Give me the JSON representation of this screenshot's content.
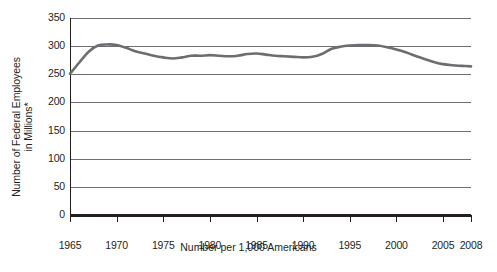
{
  "chart_data": {
    "type": "line",
    "title": "",
    "xlabel": "Number per 1,000 Americans",
    "ylabel_line1": "Number of Federal Employees",
    "ylabel_line2": "in Millions*",
    "grid": true,
    "legend": "none",
    "xlim": [
      1965,
      2008
    ],
    "ylim": [
      0,
      350
    ],
    "yticks": [
      0,
      50,
      100,
      150,
      200,
      250,
      300,
      350
    ],
    "ytick_labels": [
      "0",
      "50",
      "100",
      "150",
      "200",
      "250",
      "300",
      "350"
    ],
    "xticks": [
      1965,
      1970,
      1975,
      1980,
      1985,
      1990,
      1995,
      2000,
      2005,
      2008
    ],
    "xtick_labels": [
      "1965",
      "1970",
      "1975",
      "1980",
      "1985",
      "1990",
      "1995",
      "2000",
      "2005",
      "2008"
    ],
    "series": [
      {
        "name": "Federal employees per 1,000 Americans",
        "color": "#6b6d70",
        "x": [
          1965,
          1966,
          1967,
          1968,
          1969,
          1970,
          1971,
          1972,
          1973,
          1974,
          1975,
          1976,
          1977,
          1978,
          1979,
          1980,
          1981,
          1982,
          1983,
          1984,
          1985,
          1986,
          1987,
          1988,
          1989,
          1990,
          1991,
          1992,
          1993,
          1994,
          1995,
          1996,
          1997,
          1998,
          1999,
          2000,
          2001,
          2002,
          2003,
          2004,
          2005,
          2006,
          2007,
          2008
        ],
        "values": [
          251,
          271,
          290,
          301,
          303,
          302,
          297,
          291,
          287,
          283,
          280,
          278,
          280,
          283,
          283,
          284,
          283,
          282,
          283,
          286,
          287,
          285,
          283,
          282,
          281,
          280,
          281,
          286,
          295,
          299,
          301,
          302,
          302,
          301,
          298,
          294,
          289,
          283,
          277,
          272,
          268,
          266,
          265,
          264
        ]
      }
    ]
  }
}
